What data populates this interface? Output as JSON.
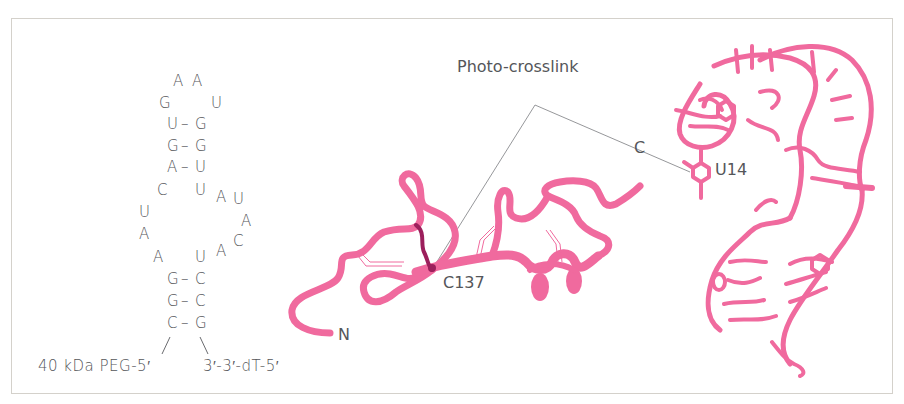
{
  "figure": {
    "border_color": "#d4d1cb",
    "ribbon_color": "#f06a9e",
    "crosslink_color": "#9c1f5c",
    "text_color": "#55565a"
  },
  "secondary_structure": {
    "loop_top": [
      "A",
      "A"
    ],
    "loop_left": "G",
    "loop_right": "U",
    "upper_stem": [
      {
        "left": "U",
        "pair": "–",
        "right": "G"
      },
      {
        "left": "G",
        "pair": "–",
        "right": "G"
      },
      {
        "left": "A",
        "pair": "–",
        "right": "U"
      }
    ],
    "internal_loop_left": [
      "C",
      "U",
      "A",
      "A"
    ],
    "internal_loop_right": [
      "U",
      "A",
      "U",
      "A",
      "C",
      "A",
      "U"
    ],
    "lower_stem": [
      {
        "left": "G",
        "pair": "–",
        "right": "C"
      },
      {
        "left": "G",
        "pair": "–",
        "right": "C"
      },
      {
        "left": "C",
        "pair": "–",
        "right": "G"
      }
    ],
    "five_prime_label": "40 kDa PEG-5′",
    "three_prime_label": "3′-3′-dT-5′"
  },
  "protein_model": {
    "n_terminus_label": "N",
    "c_terminus_label": "C",
    "crosslink_residue_label": "C137"
  },
  "rna_model": {
    "crosslink_residue_label": "U14"
  },
  "annotation": {
    "crosslink_label": "Photo-crosslink"
  }
}
